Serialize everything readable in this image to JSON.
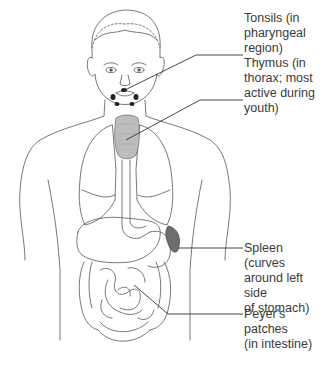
{
  "diagram": {
    "labels": [
      {
        "id": "tonsils",
        "text": "Tonsils (in\npharyngeal\nregion)",
        "x": 244,
        "y": 7
      },
      {
        "id": "thymus",
        "text": "Thymus (in\nthorax; most\nactive during\nyouth)",
        "x": 244,
        "y": 52
      },
      {
        "id": "spleen",
        "text": "Spleen (curves\naround left side\nof stomach)",
        "x": 244,
        "y": 211
      },
      {
        "id": "peyers",
        "text": "Peyer's patches\n(in intestine)",
        "x": 244,
        "y": 305
      }
    ],
    "colors": {
      "outline": "#555555",
      "thymus_fill": "#bdbdbd",
      "spleen_fill": "#6e6e6e",
      "tonsil_fill": "#222222",
      "text": "#3a3a3a",
      "leader": "#333333"
    }
  }
}
